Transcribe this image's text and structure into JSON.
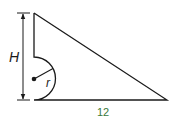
{
  "diagram": {
    "type": "geometry-figure",
    "labels": {
      "height": "H",
      "radius": "r",
      "base": "12"
    },
    "colors": {
      "stroke": "#1a1a1a",
      "base_label": "#3a7a3a"
    }
  }
}
